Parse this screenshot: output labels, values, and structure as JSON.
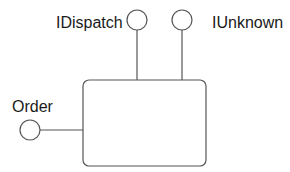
{
  "diagram": {
    "type": "COM component interface diagram",
    "component": {
      "name": "",
      "box": {
        "x": 83,
        "y": 80,
        "width": 123,
        "height": 86,
        "corner_radius": 6
      }
    },
    "interfaces": [
      {
        "id": "idispatch",
        "label": "IDispatch",
        "side": "top",
        "circle": {
          "cx": 137,
          "cy": 20,
          "r": 10
        }
      },
      {
        "id": "iunknown",
        "label": "IUnknown",
        "side": "top",
        "circle": {
          "cx": 182,
          "cy": 20,
          "r": 10
        }
      },
      {
        "id": "order",
        "label": "Order",
        "side": "left",
        "circle": {
          "cx": 30,
          "cy": 130,
          "r": 10
        }
      }
    ],
    "colors": {
      "line": "#555555",
      "text": "#1a1a1a",
      "background": "#ffffff"
    }
  }
}
